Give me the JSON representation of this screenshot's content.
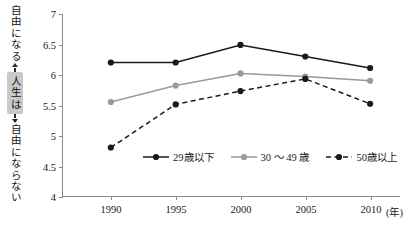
{
  "axis_caption": {
    "top": "自由になる",
    "chip": "人生は",
    "bottom": "自由にならない"
  },
  "x_unit": "(年)",
  "chart_data": {
    "type": "line",
    "title": "",
    "xlabel": "(年)",
    "ylabel": "",
    "categories": [
      "1990",
      "1995",
      "2000",
      "2005",
      "2010"
    ],
    "x": [
      1990,
      1995,
      2000,
      2005,
      2010
    ],
    "yticks": [
      "4",
      "4.5",
      "5",
      "5.5",
      "6",
      "6.5",
      "7"
    ],
    "ytick_values": [
      4,
      4.5,
      5,
      5.5,
      6,
      6.5,
      7
    ],
    "ylim": [
      4,
      7
    ],
    "grid": false,
    "legend_position": "inside-bottom-center",
    "series": [
      {
        "name": "29歳以下",
        "values": [
          6.2,
          6.2,
          6.49,
          6.3,
          6.11
        ],
        "color": "#1a1a1a",
        "dash": "none",
        "marker": "circle"
      },
      {
        "name": "30 ～ 49 歳",
        "values": [
          5.55,
          5.82,
          6.02,
          5.97,
          5.9
        ],
        "color": "#9a9a9a",
        "dash": "none",
        "marker": "circle"
      },
      {
        "name": "50歳以上",
        "values": [
          4.8,
          5.51,
          5.73,
          5.93,
          5.52
        ],
        "color": "#1a1a1a",
        "dash": "dashed",
        "marker": "circle"
      }
    ]
  }
}
